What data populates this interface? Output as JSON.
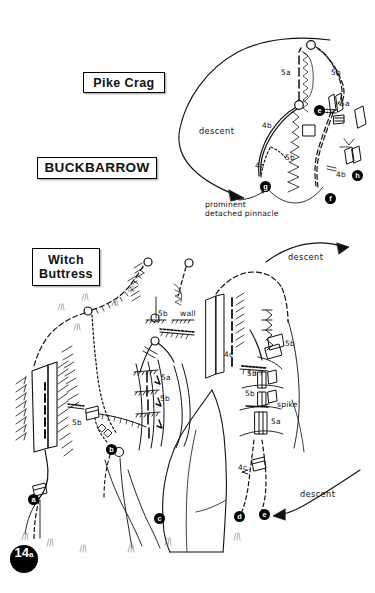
{
  "page": {
    "number": "14",
    "number_suffix": "a",
    "background_color": "#ffffff",
    "ink_color": "#111111"
  },
  "headings": {
    "crag_area": "BUCKBARROW",
    "sector_top": "Pike Crag",
    "sector_bottom_line1": "Witch",
    "sector_bottom_line2": "Buttress"
  },
  "pike_crag": {
    "grades": [
      {
        "text": "5a",
        "x": 281,
        "y": 72
      },
      {
        "text": "5b",
        "x": 331,
        "y": 72
      },
      {
        "text": "5a",
        "x": 340,
        "y": 103
      },
      {
        "text": "4b",
        "x": 264,
        "y": 125
      },
      {
        "text": "5b",
        "x": 287,
        "y": 157
      },
      {
        "text": "4c",
        "x": 257,
        "y": 165
      },
      {
        "text": "4b",
        "x": 338,
        "y": 174
      }
    ],
    "descent_label": "descent",
    "caption": "prominent\ndetached pinnacle",
    "markers": [
      {
        "letter": "g",
        "x": 260,
        "y": 181
      },
      {
        "letter": "f",
        "x": 325,
        "y": 193
      },
      {
        "letter": "h",
        "x": 352,
        "y": 170
      },
      {
        "letter": "e",
        "x": 318,
        "y": 108
      }
    ]
  },
  "witch_buttress": {
    "grades": [
      {
        "text": "5b",
        "x": 160,
        "y": 313
      },
      {
        "text": "wall",
        "x": 181,
        "y": 313
      },
      {
        "text": "5a",
        "x": 162,
        "y": 376
      },
      {
        "text": "5b",
        "x": 161,
        "y": 397
      },
      {
        "text": "5b",
        "x": 74,
        "y": 421
      },
      {
        "text": "4c",
        "x": 226,
        "y": 354
      },
      {
        "text": "5b",
        "x": 285,
        "y": 343
      },
      {
        "text": "5b",
        "x": 250,
        "y": 372
      },
      {
        "text": "5b",
        "x": 248,
        "y": 392
      },
      {
        "text": "spike",
        "x": 279,
        "y": 404
      },
      {
        "text": "5a",
        "x": 272,
        "y": 420
      },
      {
        "text": "4c",
        "x": 240,
        "y": 467
      }
    ],
    "descent_top_label": "descent",
    "descent_bottom_label": "descent",
    "markers": [
      {
        "letter": "a",
        "x": 33,
        "y": 497
      },
      {
        "letter": "b",
        "x": 110,
        "y": 449
      },
      {
        "letter": "c",
        "x": 157,
        "y": 518
      },
      {
        "letter": "d",
        "x": 237,
        "y": 515
      },
      {
        "letter": "e",
        "x": 262,
        "y": 513
      }
    ]
  }
}
